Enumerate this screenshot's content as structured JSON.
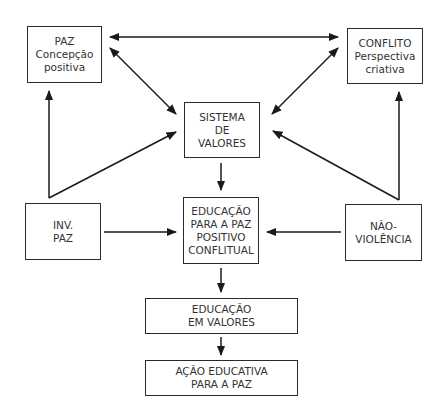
{
  "diagram": {
    "nodes": {
      "paz": {
        "lines": [
          "PAZ",
          "Concepção",
          "positiva"
        ]
      },
      "conflito": {
        "lines": [
          "CONFLITO",
          "Perspectiva",
          "criativa"
        ]
      },
      "sistema": {
        "lines": [
          "SISTEMA",
          "DE",
          "VALORES"
        ]
      },
      "inv_paz": {
        "lines": [
          "INV.",
          "PAZ"
        ]
      },
      "educacao_paz": {
        "lines": [
          "EDUCAÇÃO",
          "PARA A PAZ",
          "POSITIVO",
          "CONFLITUAL"
        ]
      },
      "nao_violencia": {
        "lines": [
          "NÃO-",
          "VIOLÊNCIA"
        ]
      },
      "educacao_valores": {
        "lines": [
          "EDUCAÇÃO",
          "EM VALORES"
        ]
      },
      "acao_educativa": {
        "lines": [
          "AÇÃO EDUCATIVA",
          "PARA A PAZ"
        ]
      }
    },
    "edges": [
      {
        "from": "paz",
        "to": "conflito",
        "direction": "both"
      },
      {
        "from": "paz",
        "to": "sistema",
        "direction": "both"
      },
      {
        "from": "conflito",
        "to": "sistema",
        "direction": "both"
      },
      {
        "from": "inv_paz",
        "to": "paz",
        "direction": "forward"
      },
      {
        "from": "inv_paz",
        "to": "sistema",
        "direction": "forward"
      },
      {
        "from": "nao_violencia",
        "to": "conflito",
        "direction": "forward"
      },
      {
        "from": "nao_violencia",
        "to": "sistema",
        "direction": "forward"
      },
      {
        "from": "sistema",
        "to": "educacao_paz",
        "direction": "forward"
      },
      {
        "from": "inv_paz",
        "to": "educacao_paz",
        "direction": "forward"
      },
      {
        "from": "nao_violencia",
        "to": "educacao_paz",
        "direction": "forward"
      },
      {
        "from": "educacao_paz",
        "to": "educacao_valores",
        "direction": "forward"
      },
      {
        "from": "educacao_valores",
        "to": "acao_educativa",
        "direction": "forward"
      }
    ]
  }
}
